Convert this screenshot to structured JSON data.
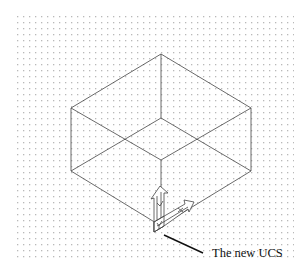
{
  "diagram": {
    "type": "isometric-wireframe",
    "grid": {
      "x": 17,
      "y": 16,
      "width": 277,
      "height": 246,
      "spacing": 6,
      "dot_color": "#b9b9b9"
    },
    "line_color": "#444444",
    "box": {
      "vertices": {
        "top_back": [
          161,
          54
        ],
        "left_top": [
          71,
          108
        ],
        "right_top": [
          251,
          108
        ],
        "inner_top": [
          161,
          118
        ],
        "front_top": [
          161,
          160
        ],
        "left_bottom": [
          71,
          171
        ],
        "right_bottom": [
          251,
          171
        ],
        "front_bottom": [
          161,
          226
        ]
      }
    },
    "ucs_icon": {
      "origin": [
        155,
        232
      ],
      "description": "UCS icon with Y arrow up and X arrow to the right"
    },
    "callout": {
      "text": "The new UCS",
      "leader_from": [
        164,
        235
      ],
      "leader_to": [
        203,
        253
      ],
      "text_position": [
        212,
        257
      ]
    }
  }
}
